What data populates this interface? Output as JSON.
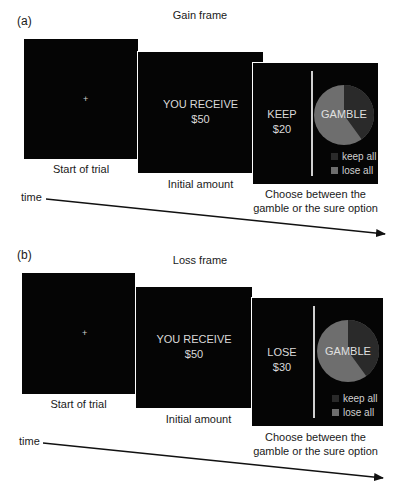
{
  "panels": [
    {
      "label": "(a)",
      "title": "Gain frame",
      "start": {
        "fixation": "+",
        "caption": "Start of trial"
      },
      "initial": {
        "line1": "YOU RECEIVE",
        "line2": "$50",
        "caption": "Initial amount"
      },
      "choice": {
        "sure_line1": "KEEP",
        "sure_line2": "$20",
        "gamble_label": "GAMBLE",
        "legend": [
          {
            "label": "keep all",
            "color": "#2a2a2a"
          },
          {
            "label": "lose all",
            "color": "#6e6e6e"
          }
        ],
        "caption_line1": "Choose between the",
        "caption_line2": "gamble or the sure option"
      },
      "time_label": "time"
    },
    {
      "label": "(b)",
      "title": "Loss frame",
      "start": {
        "fixation": "+",
        "caption": "Start of trial"
      },
      "initial": {
        "line1": "YOU RECEIVE",
        "line2": "$50",
        "caption": "Initial amount"
      },
      "choice": {
        "sure_line1": "LOSE",
        "sure_line2": "$30",
        "gamble_label": "GAMBLE",
        "legend": [
          {
            "label": "keep all",
            "color": "#2a2a2a"
          },
          {
            "label": "lose all",
            "color": "#6e6e6e"
          }
        ],
        "caption_line1": "Choose between the",
        "caption_line2": "gamble or the sure option"
      },
      "time_label": "time"
    }
  ],
  "pie": {
    "keep_all_fraction": 0.4,
    "lose_all_fraction": 0.6
  }
}
